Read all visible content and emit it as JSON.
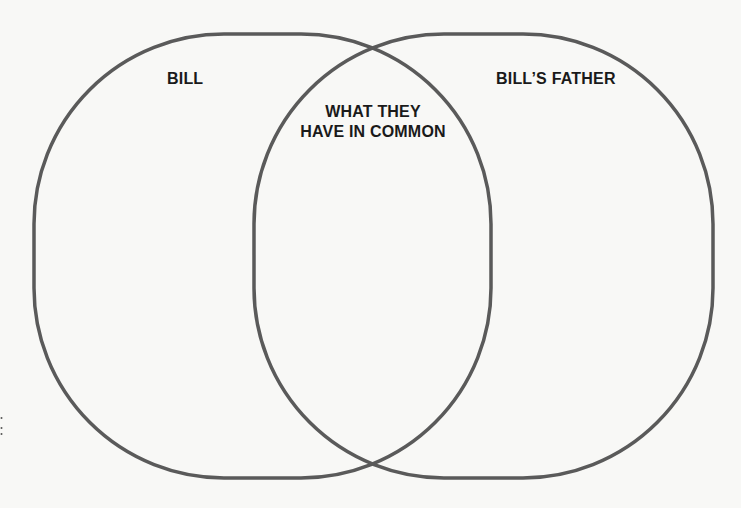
{
  "diagram": {
    "type": "venn",
    "sets": [
      {
        "id": "left",
        "label": "BILL"
      },
      {
        "id": "right",
        "label": "BILL’S FATHER"
      }
    ],
    "intersection": {
      "label_line1": "WHAT THEY",
      "label_line2": "HAVE IN COMMON"
    },
    "colors": {
      "background": "#f8f8f6",
      "outline": "#5a5a5a",
      "text": "#1a1a1a",
      "seal": "#6b6b6b"
    },
    "decorations": [
      {
        "name": "seal-badge",
        "position": "top-right, partially cropped"
      }
    ]
  }
}
